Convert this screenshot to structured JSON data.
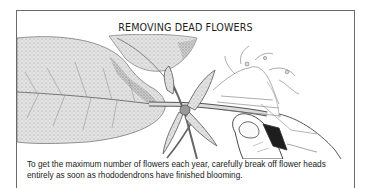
{
  "figure": {
    "title": "REMOVING DEAD FLOWERS",
    "illustration": {
      "description": "Pencil drawing of a rhododendron stem with large leaves; a hand (thumb and fingers) breaks off a spent flower head",
      "elements": [
        "large-leaf-left",
        "leaf-top-center",
        "stem",
        "new-leaf-buds",
        "spent-flower-head",
        "hand-thumb"
      ]
    },
    "caption": "To get the maximum number of flowers each year, carefully break off flower heads entirely as soon as rhododendrons have finished blooming."
  },
  "colors": {
    "border": "#6a6a6a",
    "ink": "#1e1e1e",
    "pencil": "#8a8a8a",
    "background": "#ffffff"
  }
}
